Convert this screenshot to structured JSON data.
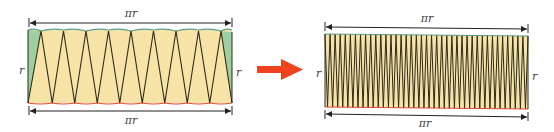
{
  "diagram": {
    "left": {
      "top_label": "πr",
      "bottom_label": "πr",
      "left_side_label": "r",
      "right_side_label": "r",
      "sector_count_visible": 8,
      "description": "Circle cut into sectors rearranged alternately; wavy arc edges top and bottom; green half-sectors at ends"
    },
    "arrow": {
      "direction": "right",
      "color": "#f0421c"
    },
    "right": {
      "top_label": "πr",
      "bottom_label": "πr",
      "left_side_label": "r",
      "right_side_label": "r",
      "sector_count_visible": 40,
      "description": "Many thin sectors approach a rectangle of width πr and height r"
    },
    "colors": {
      "sector_fill": "#f7e3a6",
      "end_sector_fill": "#9fcfa0",
      "outline": "#2a2a1e",
      "top_arc": "#5a9c8a",
      "bottom_arc": "#e2493a",
      "arrow": "#f0421c",
      "label": "#444444"
    }
  }
}
